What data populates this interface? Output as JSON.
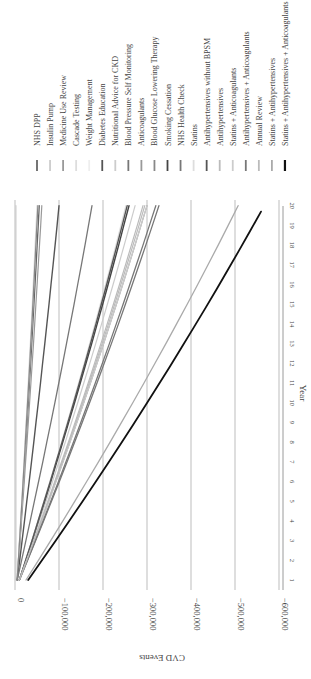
{
  "chart_data": {
    "type": "line",
    "orientation": "rotated-90-clockwise",
    "title": "",
    "xlabel": "Year",
    "ylabel": "CVD Events",
    "x": [
      1,
      2,
      3,
      4,
      5,
      6,
      7,
      8,
      9,
      10,
      11,
      12,
      13,
      14,
      15,
      16,
      17,
      18,
      19,
      20
    ],
    "x_ticks": [
      "1",
      "2",
      "3",
      "4",
      "5",
      "6",
      "7",
      "8",
      "9",
      "10",
      "11",
      "12",
      "13",
      "14",
      "15",
      "16",
      "17",
      "18",
      "19",
      "20"
    ],
    "ylim": [
      -600000,
      0
    ],
    "y_ticks": [
      0,
      -100000,
      -200000,
      -300000,
      -400000,
      -500000,
      -600000
    ],
    "y_tick_labels": [
      "0",
      "−100,000",
      "−200,000",
      "−300,000",
      "−400,000",
      "−500,000",
      "−600,000"
    ],
    "grid": true,
    "legend_position": "right",
    "series": [
      {
        "name": "NHS DPP",
        "color": "#666666",
        "width": 1.4,
        "start": -5000,
        "end": -55000
      },
      {
        "name": "Insulin Pump",
        "color": "#cccccc",
        "width": 1.2,
        "start": -2000,
        "end": -2000
      },
      {
        "name": "Medicine Use Review",
        "color": "#999999",
        "width": 1.2,
        "start": -5000,
        "end": -61000
      },
      {
        "name": "Cascade Testing",
        "color": "#dddddd",
        "width": 1.2,
        "start": -5000,
        "end": -50000
      },
      {
        "name": "Weight Management",
        "color": "#eeeeee",
        "width": 1.2,
        "start": -5000,
        "end": -52000
      },
      {
        "name": "Diabetes Education",
        "color": "#555555",
        "width": 1.4,
        "start": -5000,
        "end": -100000
      },
      {
        "name": "Nutritional Advice for CKD",
        "color": "#cccccc",
        "width": 1.2,
        "start": -10000,
        "end": -273000
      },
      {
        "name": "Blood Pressure Self Monitoring",
        "color": "#777777",
        "width": 1.3,
        "start": -5000,
        "end": -175000
      },
      {
        "name": "Anticoagulants",
        "color": "#999999",
        "width": 1.2,
        "start": -10000,
        "end": -300000
      },
      {
        "name": "Blood Glucose Lowering Therapy",
        "color": "#888888",
        "width": 1.3,
        "start": -5000,
        "end": -52000
      },
      {
        "name": "Smoking Cessation",
        "color": "#444444",
        "width": 1.4,
        "start": -10000,
        "end": -259000
      },
      {
        "name": "NHS Health Check",
        "color": "#777777",
        "width": 1.3,
        "start": -10000,
        "end": -327000
      },
      {
        "name": "Statins",
        "color": "#dddddd",
        "width": 1.2,
        "start": -10000,
        "end": -252000
      },
      {
        "name": "Antihypertensives without BPSM",
        "color": "#555555",
        "width": 1.4,
        "start": -10000,
        "end": -255000
      },
      {
        "name": "Antihypertensives",
        "color": "#bbbbbb",
        "width": 1.2,
        "start": -10000,
        "end": -291000
      },
      {
        "name": "Statins + Anticoagulants",
        "color": "#cccccc",
        "width": 1.2,
        "start": -10000,
        "end": -300000
      },
      {
        "name": "Antihypertensives + Anticoagulants",
        "color": "#777777",
        "width": 1.3,
        "start": -10000,
        "end": -320000
      },
      {
        "name": "Annual Review",
        "color": "#bbbbbb",
        "width": 1.2,
        "start": -10000,
        "end": -295000
      },
      {
        "name": "Statins + Antihypertensives",
        "color": "#aaaaaa",
        "width": 1.3,
        "start": -25000,
        "end": -507000
      },
      {
        "name": "Statins + Antihypertensives + Anticoagulants",
        "color": "#111111",
        "width": 1.8,
        "start": -30000,
        "end": -559000
      }
    ]
  }
}
